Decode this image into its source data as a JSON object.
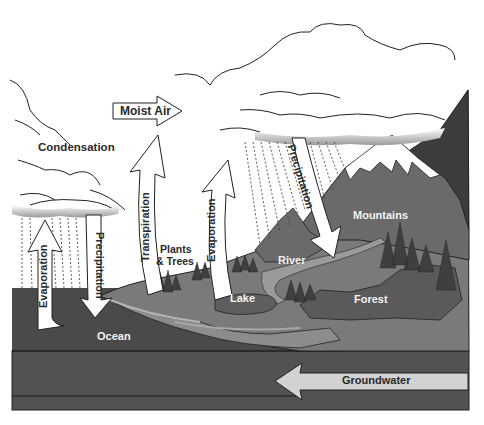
{
  "diagram": {
    "labels": {
      "moist_air": "Moist Air",
      "condensation": "Condensation",
      "transpiration": "Transpiration",
      "evaporation_left": "Evaporation",
      "precipitation_left": "Precipitation",
      "evaporation_lake": "Evaporation",
      "precipitation_right": "Precipitation",
      "plants_trees_line1": "Plants",
      "plants_trees_line2": "& Trees",
      "mountains": "Mountains",
      "river": "River",
      "lake": "Lake",
      "forest": "Forest",
      "ocean": "Ocean",
      "groundwater": "Groundwater"
    },
    "colors": {
      "background": "#ffffff",
      "ocean": "#4a4a4a",
      "ground_band": "#525252",
      "land": "#7a7a7a",
      "mountain": "#6a6a6a",
      "dark_mountain": "#3c3c3c",
      "forest": "#4e4e4e",
      "lake": "#8c8c8c",
      "arrow_fill": "#ffffff",
      "groundwater_arrow": "#d2d2d2",
      "outline": "#222222"
    }
  }
}
